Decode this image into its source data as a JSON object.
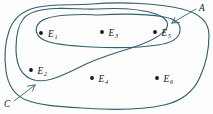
{
  "diagram": {
    "type": "venn-set-diagram",
    "stroke_color": "#33606f",
    "dot_color": "#151515",
    "background_color": "#fdfdfd",
    "sample_space_label": "",
    "set_labels": [
      {
        "name": "A",
        "text": "A",
        "description": "oval set containing E3 and E5",
        "arrow": "points down-left toward oval boundary"
      },
      {
        "name": "C",
        "text": "C",
        "description": "irregular blob containing E1, E2, E3",
        "arrow": "points up-right toward blob boundary"
      }
    ],
    "outcomes": [
      {
        "name": "E1",
        "base": "E",
        "sub": "1",
        "in_sets": [
          "C"
        ]
      },
      {
        "name": "E2",
        "base": "E",
        "sub": "2",
        "in_sets": [
          "C"
        ]
      },
      {
        "name": "E3",
        "base": "E",
        "sub": "3",
        "in_sets": [
          "C",
          "A"
        ]
      },
      {
        "name": "E4",
        "base": "E",
        "sub": "4",
        "in_sets": []
      },
      {
        "name": "E5",
        "base": "E",
        "sub": "5",
        "in_sets": [
          "A"
        ]
      },
      {
        "name": "E6",
        "base": "E",
        "sub": "6",
        "in_sets": []
      }
    ]
  }
}
